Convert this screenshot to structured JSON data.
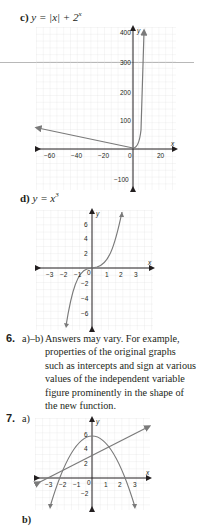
{
  "part_c": {
    "label": "c)",
    "equation": "y = |x| + 2",
    "exponent": "x",
    "graph": {
      "x_ticks": [
        "−60",
        "−40",
        "−20",
        "0",
        "20"
      ],
      "y_ticks": [
        "400",
        "300",
        "200",
        "100",
        "−100"
      ],
      "x_axis_label": "x",
      "y_axis_label": "y"
    }
  },
  "part_d": {
    "label": "d)",
    "equation": "y = x",
    "exponent": "3",
    "graph": {
      "x_ticks": [
        "−3",
        "−2",
        "−1",
        "0",
        "1",
        "2",
        "3"
      ],
      "y_ticks": [
        "6",
        "4",
        "2",
        "−2",
        "−4",
        "−6"
      ],
      "x_axis_label": "x",
      "y_axis_label": "y"
    }
  },
  "q6": {
    "number": "6.",
    "label": "a)–b)",
    "lines": [
      "Answers may vary. For example,",
      "properties of the original graphs",
      "such as intercepts and sign at various",
      "values of the independent variable",
      "figure prominently in the shape of",
      "the new function."
    ]
  },
  "q7": {
    "number": "7.",
    "part_a_label": "a)",
    "part_b_label": "b)",
    "graph": {
      "x_ticks": [
        "−3",
        "−2",
        "−1",
        "0",
        "1",
        "2",
        "3"
      ],
      "y_ticks": [
        "6",
        "4",
        "2",
        "−2"
      ],
      "x_axis_label": "x",
      "y_axis_label": "y"
    }
  },
  "colors": {
    "curve": "#7a7a7a",
    "axis": "#231f20",
    "grid": "#e2e2e2",
    "text": "#231f20"
  }
}
